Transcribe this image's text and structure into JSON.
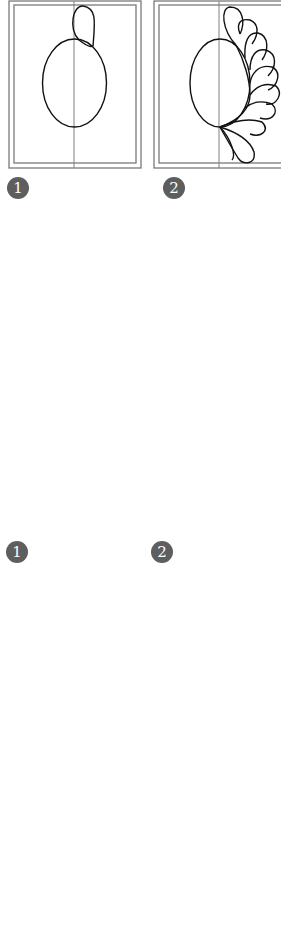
{
  "figure": {
    "sections": [
      {
        "name": "oval-feather-wreath",
        "steps": [
          {
            "badge": "1",
            "caption": "Oval with first feather plume"
          },
          {
            "badge": "2",
            "caption": "Feathers added along right side of oval"
          }
        ],
        "result": "Completed oval feather wreath"
      },
      {
        "name": "heart-feather",
        "steps": [
          {
            "badge": "1",
            "caption": "Half heart with first feathers"
          },
          {
            "badge": "2",
            "caption": "Feathers added along half heart"
          }
        ],
        "results": [
          "Heart feather in diamond (on-point square) block",
          "Heart feather wreath in triangle block",
          "Partial rectangular block with feathers (cropped)"
        ]
      }
    ]
  },
  "colors": {
    "background": "#ffffff",
    "ink": "#111111",
    "frame": "#7a7a7a",
    "badge": "#5e5e5e",
    "separator": "#cfcfcf"
  }
}
